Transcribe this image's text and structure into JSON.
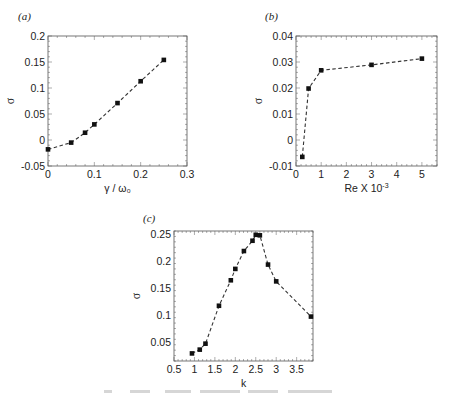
{
  "figure": {
    "panels": [
      "(a)",
      "(b)",
      "(c)"
    ]
  },
  "chart_data": [
    {
      "type": "line",
      "panel": "(a)",
      "title": "",
      "xlabel": "γ / ω₀",
      "ylabel": "σ",
      "xlim": [
        0,
        0.3
      ],
      "ylim": [
        -0.05,
        0.2
      ],
      "xticks": [
        0,
        0.1,
        0.2,
        0.3
      ],
      "xtick_labels": [
        "0",
        "0.1",
        "0.2",
        "0.3"
      ],
      "yticks": [
        -0.05,
        0,
        0.05,
        0.1,
        0.15,
        0.2
      ],
      "ytick_labels": [
        "-0.05",
        "0",
        "0.05",
        "0.1",
        "0.15",
        "0.2"
      ],
      "grid": false,
      "line_style": "dashed",
      "marker": "square",
      "series": [
        {
          "name": "σ",
          "x": [
            0,
            0.05,
            0.08,
            0.1,
            0.15,
            0.2,
            0.25
          ],
          "y": [
            -0.018,
            -0.005,
            0.014,
            0.03,
            0.071,
            0.113,
            0.154
          ]
        }
      ]
    },
    {
      "type": "line",
      "panel": "(b)",
      "title": "",
      "xlabel": "Re X 10",
      "xlabel_sup": "-3",
      "ylabel": "σ",
      "xlim": [
        0,
        5.6
      ],
      "ylim": [
        -0.01,
        0.04
      ],
      "xticks": [
        0,
        1,
        2,
        3,
        4,
        5
      ],
      "xtick_labels": [
        "0",
        "1",
        "2",
        "3",
        "4",
        "5"
      ],
      "yticks": [
        -0.01,
        0,
        0.01,
        0.02,
        0.03,
        0.04
      ],
      "ytick_labels": [
        "-0.01",
        "0",
        "0.01",
        "0.02",
        "0.03",
        "0.04"
      ],
      "grid": false,
      "line_style": "dashed",
      "marker": "square",
      "series": [
        {
          "name": "σ",
          "x": [
            0.25,
            0.5,
            1,
            3,
            5
          ],
          "y": [
            -0.0065,
            0.0198,
            0.0268,
            0.0289,
            0.0313
          ]
        }
      ]
    },
    {
      "type": "line",
      "panel": "(c)",
      "title": "",
      "xlabel": "k",
      "ylabel": "σ",
      "xlim": [
        0.5,
        3.9
      ],
      "ylim": [
        0.015,
        0.255
      ],
      "xticks": [
        0.5,
        1,
        1.5,
        2,
        2.5,
        3,
        3.5
      ],
      "xtick_labels": [
        "0.5",
        "1",
        "1.5",
        "2",
        "2.5",
        "3",
        "3.5"
      ],
      "yticks": [
        0.05,
        0.1,
        0.15,
        0.2,
        0.25
      ],
      "ytick_labels": [
        "0.05",
        "0.1",
        "0.15",
        "0.2",
        "0.25"
      ],
      "grid": false,
      "line_style": "dashed",
      "marker": "square",
      "series": [
        {
          "name": "σ",
          "x": [
            0.94,
            1.13,
            1.27,
            1.6,
            1.89,
            2.0,
            2.21,
            2.42,
            2.5,
            2.6,
            2.8,
            3.0,
            3.85
          ],
          "y": [
            0.029,
            0.036,
            0.047,
            0.117,
            0.164,
            0.185,
            0.218,
            0.237,
            0.248,
            0.247,
            0.193,
            0.162,
            0.097
          ]
        }
      ]
    }
  ]
}
